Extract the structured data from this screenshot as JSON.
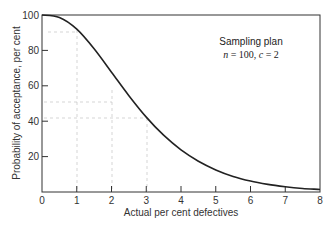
{
  "chart_data": {
    "type": "line",
    "title": "",
    "xlabel": "Actual per cent defectives",
    "ylabel": "Probability of acceptance, per cent",
    "xlim": [
      0,
      8
    ],
    "ylim": [
      0,
      100
    ],
    "x_ticks": [
      "0",
      "1",
      "2",
      "3",
      "4",
      "5",
      "6",
      "7",
      "8"
    ],
    "y_ticks": [
      "20",
      "40",
      "60",
      "80",
      "100"
    ],
    "grid": false,
    "legend": null,
    "annotations": [
      {
        "text_line1": "Sampling plan",
        "text_line2": "n = 100, c = 2",
        "position": "upper right"
      }
    ],
    "series": [
      {
        "name": "OC curve",
        "color": "#222222",
        "x": [
          0,
          0.5,
          1,
          1.5,
          2,
          2.5,
          3,
          3.5,
          4,
          4.5,
          5,
          5.5,
          6,
          6.5,
          7,
          7.5,
          8
        ],
        "values": [
          100,
          98.6,
          92,
          80.9,
          67.7,
          54.4,
          42.3,
          32.1,
          23.8,
          17.4,
          12.5,
          8.8,
          6.2,
          4.3,
          3.0,
          2.0,
          1.4
        ]
      }
    ]
  },
  "labels": {
    "annotation_line1": "Sampling plan",
    "n_label": "n",
    "n_eq": " = 100, ",
    "c_label": "c",
    "c_eq": " = 2",
    "xlabel": "Actual per cent defectives",
    "ylabel": "Probability of acceptance, per cent",
    "x0": "0",
    "x1": "1",
    "x2": "2",
    "x3": "3",
    "x4": "4",
    "x5": "5",
    "x6": "6",
    "x7": "7",
    "x8": "8",
    "y20": "20",
    "y40": "40",
    "y60": "60",
    "y80": "80",
    "y100": "100"
  }
}
